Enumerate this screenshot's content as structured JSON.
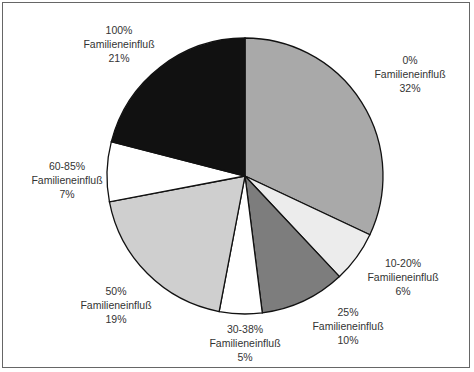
{
  "chart_data": {
    "type": "pie",
    "title": "",
    "center": [
      245,
      176
    ],
    "radius": 138,
    "start_angle_deg": 0,
    "direction": "clockwise",
    "slices": [
      {
        "category": "0% Familieneinfluß",
        "label1": "0%",
        "label2": "Familieneinfluß",
        "value": 32,
        "value_label": "32%",
        "color": "#a9a9a9",
        "label_pos": [
          410,
          53
        ]
      },
      {
        "category": "10-20% Familieneinfluß",
        "label1": "10-20%",
        "label2": "Familieneinfluß",
        "value": 6,
        "value_label": "6%",
        "color": "#ececec",
        "label_pos": [
          403,
          256
        ]
      },
      {
        "category": "25% Familieneinfluß",
        "label1": "25%",
        "label2": "Familieneinfluß",
        "value": 10,
        "value_label": "10%",
        "color": "#7d7d7d",
        "label_pos": [
          348,
          305
        ]
      },
      {
        "category": "30-38% Familieneinfluß",
        "label1": "30-38%",
        "label2": "Familieneinfluß",
        "value": 5,
        "value_label": "5%",
        "color": "#ffffff",
        "label_pos": [
          245,
          322
        ]
      },
      {
        "category": "50% Familieneinfluß",
        "label1": "50%",
        "label2": "Familieneinfluß",
        "value": 19,
        "value_label": "19%",
        "color": "#cfcfcf",
        "label_pos": [
          116,
          284
        ]
      },
      {
        "category": "60-85% Familieneinfluß",
        "label1": "60-85%",
        "label2": "Familieneinfluß",
        "value": 7,
        "value_label": "7%",
        "color": "#ffffff",
        "label_pos": [
          67,
          159
        ]
      },
      {
        "category": "100% Familieneinfluß",
        "label1": "100%",
        "label2": "Familieneinfluß",
        "value": 21,
        "value_label": "21%",
        "color": "#111111",
        "label_pos": [
          119,
          23
        ]
      }
    ],
    "legend": "none",
    "grid": false
  }
}
